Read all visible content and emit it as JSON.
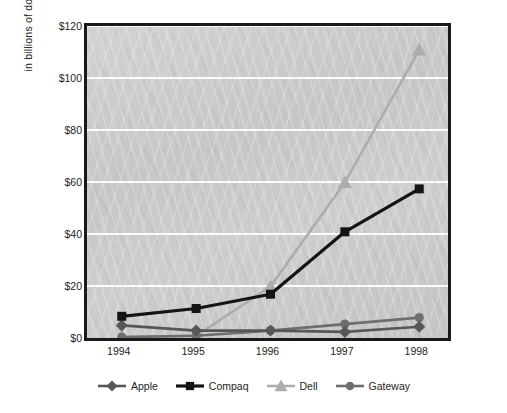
{
  "chart_data": {
    "type": "line",
    "title": "",
    "subtitle": "",
    "xlabel": "",
    "ylabel": "in billions of dollars",
    "categories": [
      "1994",
      "1995",
      "1996",
      "1997",
      "1998"
    ],
    "x": [
      1994,
      1995,
      1996,
      1997,
      1998
    ],
    "ylim": [
      0,
      120
    ],
    "ytick_values": [
      0,
      20,
      40,
      60,
      80,
      100,
      120
    ],
    "ytick_labels": [
      "$0",
      "$20",
      "$40",
      "$60",
      "$80",
      "$100",
      "$120"
    ],
    "grid": "horizontal",
    "legend_position": "bottom",
    "series": [
      {
        "name": "Apple",
        "marker": "diamond",
        "color": "#575757",
        "values": [
          6.0,
          4.0,
          4.0,
          3.5,
          5.5
        ]
      },
      {
        "name": "Compaq",
        "marker": "square",
        "color": "#141414",
        "values": [
          9.5,
          12.5,
          18.0,
          42.0,
          58.5
        ]
      },
      {
        "name": "Dell",
        "marker": "triangle",
        "color": "#adadad",
        "values": [
          1.5,
          2.0,
          21.0,
          61.0,
          112.0
        ]
      },
      {
        "name": "Gateway",
        "marker": "circle",
        "color": "#6e6e6e",
        "values": [
          1.5,
          2.0,
          4.0,
          6.5,
          9.0
        ]
      }
    ]
  },
  "axes": {
    "y_title": "in billions of dollars",
    "y_labels": [
      "$120",
      "$100",
      "$80",
      "$60",
      "$40",
      "$20",
      "$0"
    ],
    "x_labels": [
      "1994",
      "1995",
      "1996",
      "1997",
      "1998"
    ]
  },
  "legend": {
    "items": [
      {
        "label": "Apple",
        "marker": "diamond-marker-icon",
        "color": "#575757"
      },
      {
        "label": "Compaq",
        "marker": "square-marker-icon",
        "color": "#141414"
      },
      {
        "label": "Dell",
        "marker": "triangle-marker-icon",
        "color": "#adadad"
      },
      {
        "label": "Gateway",
        "marker": "circle-marker-icon",
        "color": "#6e6e6e"
      }
    ]
  },
  "style": {
    "plot_background": "#c9c9c9",
    "gridline_color": "#ffffff",
    "frame_color": "#1a1a1a",
    "text_color": "#1d1d1d"
  }
}
